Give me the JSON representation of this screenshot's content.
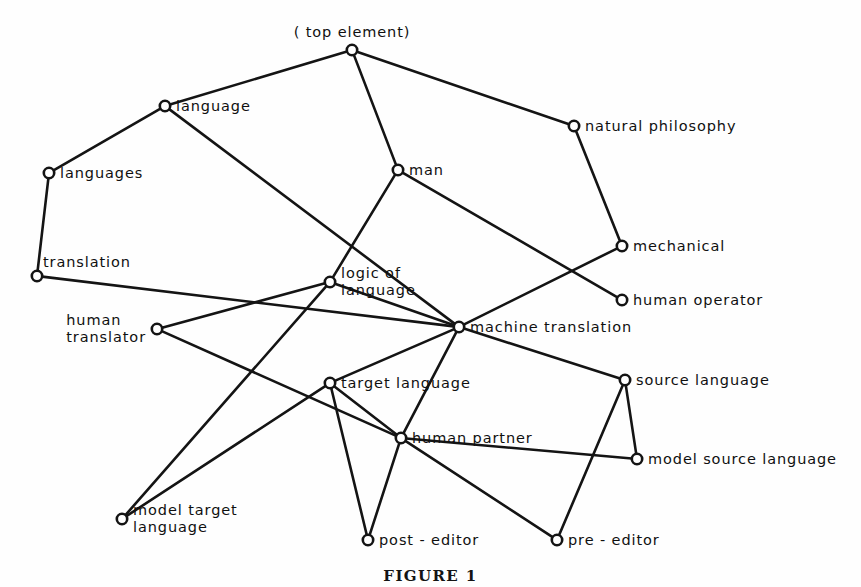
{
  "figure": {
    "caption": "FIGURE 1",
    "type": "node-link concept lattice diagram"
  },
  "chart_data": {
    "type": "diagram",
    "title": "",
    "style": {
      "line_color": "#141414",
      "node_fill": "#ffffff",
      "background": "#ffffff"
    },
    "nodes": [
      {
        "id": "top",
        "label": "( top element)",
        "x": 352,
        "y": 50,
        "label_pos": "above",
        "lines": [
          "( top element)"
        ]
      },
      {
        "id": "language",
        "label": "language",
        "x": 165,
        "y": 106,
        "label_pos": "right",
        "lines": [
          "language"
        ]
      },
      {
        "id": "natphil",
        "label": "natural philosophy",
        "x": 574,
        "y": 126,
        "label_pos": "right",
        "lines": [
          "natural philosophy"
        ]
      },
      {
        "id": "man",
        "label": "man",
        "x": 398,
        "y": 170,
        "label_pos": "right",
        "lines": [
          "man"
        ]
      },
      {
        "id": "languages",
        "label": "languages",
        "x": 49,
        "y": 173,
        "label_pos": "right",
        "lines": [
          "languages"
        ]
      },
      {
        "id": "mechanical",
        "label": "mechanical",
        "x": 622,
        "y": 246,
        "label_pos": "right",
        "lines": [
          "mechanical"
        ]
      },
      {
        "id": "translation",
        "label": "translation",
        "x": 37,
        "y": 276,
        "label_pos": "above-right",
        "lines": [
          "translation"
        ]
      },
      {
        "id": "logicoflang",
        "label": "logic of language",
        "x": 330,
        "y": 282,
        "label_pos": "right-two",
        "lines": [
          "logic of",
          "language"
        ]
      },
      {
        "id": "humanop",
        "label": "human operator",
        "x": 622,
        "y": 300,
        "label_pos": "right",
        "lines": [
          "human operator"
        ]
      },
      {
        "id": "humantrans",
        "label": "human translator",
        "x": 157,
        "y": 329,
        "label_pos": "left-two",
        "lines": [
          "human",
          "translator"
        ]
      },
      {
        "id": "machtrans",
        "label": "machine translation",
        "x": 459,
        "y": 327,
        "label_pos": "right",
        "lines": [
          "machine translation"
        ]
      },
      {
        "id": "targetlang",
        "label": "target language",
        "x": 330,
        "y": 383,
        "label_pos": "right",
        "lines": [
          "target language"
        ]
      },
      {
        "id": "sourcelang",
        "label": "source language",
        "x": 625,
        "y": 380,
        "label_pos": "right",
        "lines": [
          "source language"
        ]
      },
      {
        "id": "humanpart",
        "label": "human partner",
        "x": 401,
        "y": 438,
        "label_pos": "right",
        "lines": [
          "human partner"
        ]
      },
      {
        "id": "modelsrc",
        "label": "model source language",
        "x": 637,
        "y": 459,
        "label_pos": "right",
        "lines": [
          "model source language"
        ]
      },
      {
        "id": "modeltgt",
        "label": "model target language",
        "x": 122,
        "y": 519,
        "label_pos": "right-two",
        "lines": [
          "model target",
          "language"
        ]
      },
      {
        "id": "posteditor",
        "label": "post-editor",
        "x": 368,
        "y": 540,
        "label_pos": "right",
        "lines": [
          "post - editor"
        ]
      },
      {
        "id": "preeditor",
        "label": "pre-editor",
        "x": 557,
        "y": 540,
        "label_pos": "right",
        "lines": [
          "pre - editor"
        ]
      }
    ],
    "edges": [
      {
        "from": "top",
        "to": "language"
      },
      {
        "from": "top",
        "to": "man"
      },
      {
        "from": "top",
        "to": "natphil"
      },
      {
        "from": "language",
        "to": "languages"
      },
      {
        "from": "language",
        "to": "machtrans"
      },
      {
        "from": "languages",
        "to": "translation"
      },
      {
        "from": "natphil",
        "to": "mechanical"
      },
      {
        "from": "man",
        "to": "logicoflang"
      },
      {
        "from": "man",
        "to": "humanop"
      },
      {
        "from": "mechanical",
        "to": "machtrans"
      },
      {
        "from": "translation",
        "to": "machtrans"
      },
      {
        "from": "logicoflang",
        "to": "humantrans"
      },
      {
        "from": "logicoflang",
        "to": "machtrans"
      },
      {
        "from": "logicoflang",
        "to": "modeltgt"
      },
      {
        "from": "humantrans",
        "to": "humanpart"
      },
      {
        "from": "machtrans",
        "to": "targetlang"
      },
      {
        "from": "machtrans",
        "to": "sourcelang"
      },
      {
        "from": "machtrans",
        "to": "humanpart"
      },
      {
        "from": "targetlang",
        "to": "humanpart"
      },
      {
        "from": "targetlang",
        "to": "posteditor"
      },
      {
        "from": "targetlang",
        "to": "modeltgt"
      },
      {
        "from": "sourcelang",
        "to": "modelsrc"
      },
      {
        "from": "sourcelang",
        "to": "preeditor"
      },
      {
        "from": "humanpart",
        "to": "posteditor"
      },
      {
        "from": "humanpart",
        "to": "modelsrc"
      },
      {
        "from": "humanpart",
        "to": "preeditor"
      }
    ]
  }
}
